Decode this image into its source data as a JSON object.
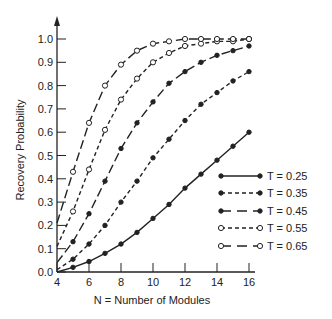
{
  "chart_data": {
    "type": "line",
    "title": "",
    "xlabel": "N = Number of Modules",
    "ylabel": "Recovery Probability",
    "xlim": [
      4,
      16
    ],
    "ylim": [
      0.0,
      1.0
    ],
    "x_ticks": [
      "4",
      "6",
      "8",
      "10",
      "12",
      "14",
      "16"
    ],
    "y_ticks": [
      "0.0",
      "0.1",
      "0.2",
      "0.3",
      "0.4",
      "0.5",
      "0.6",
      "0.7",
      "0.8",
      "0.9",
      "1.0"
    ],
    "grid": false,
    "legend_position": "lower right",
    "x": [
      4,
      5,
      6,
      7,
      8,
      9,
      10,
      11,
      12,
      13,
      14,
      15,
      16
    ],
    "series": [
      {
        "name": "T = 0.25",
        "style": "solid",
        "marker": "filled",
        "values": [
          0.0,
          0.02,
          0.045,
          0.08,
          0.12,
          0.17,
          0.23,
          0.29,
          0.36,
          0.42,
          0.48,
          0.54,
          0.6
        ]
      },
      {
        "name": "T = 0.35",
        "style": "short-dash",
        "marker": "filled",
        "values": [
          0.01,
          0.055,
          0.12,
          0.2,
          0.3,
          0.39,
          0.49,
          0.57,
          0.65,
          0.72,
          0.77,
          0.82,
          0.86
        ]
      },
      {
        "name": "T = 0.45",
        "style": "long-dash",
        "marker": "filled",
        "values": [
          0.04,
          0.13,
          0.25,
          0.39,
          0.53,
          0.64,
          0.73,
          0.81,
          0.86,
          0.9,
          0.93,
          0.95,
          0.97
        ]
      },
      {
        "name": "T = 0.55",
        "style": "short-dash",
        "marker": "open",
        "values": [
          0.11,
          0.26,
          0.44,
          0.61,
          0.74,
          0.83,
          0.9,
          0.94,
          0.97,
          0.98,
          0.99,
          0.99,
          1.0
        ]
      },
      {
        "name": "T = 0.65",
        "style": "long-dash",
        "marker": "open",
        "values": [
          0.21,
          0.43,
          0.64,
          0.8,
          0.89,
          0.95,
          0.98,
          0.99,
          1.0,
          1.0,
          1.0,
          1.0,
          1.0
        ]
      }
    ]
  }
}
